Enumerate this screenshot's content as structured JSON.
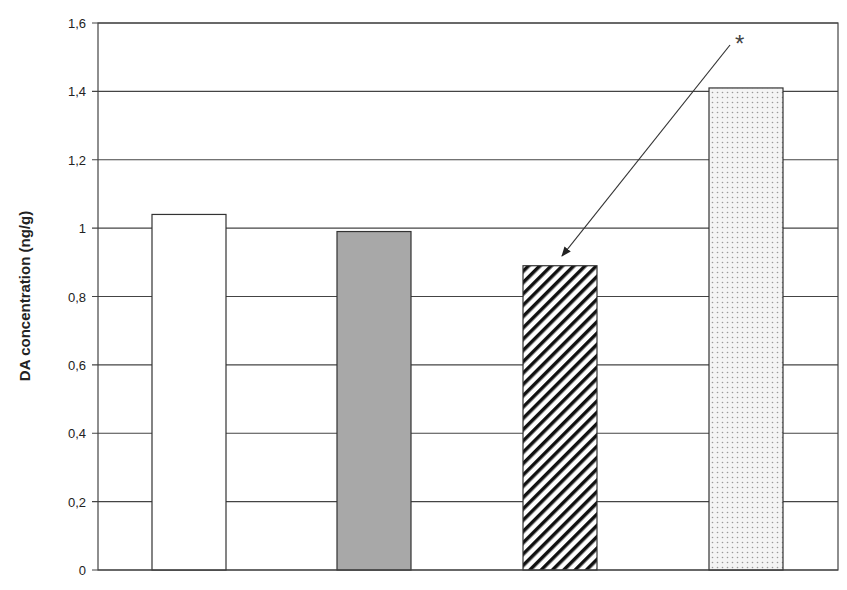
{
  "chart_data": {
    "type": "bar",
    "title": "",
    "xlabel": "",
    "ylabel": "DA concentration (ng/g)",
    "ylim": [
      0,
      1.6
    ],
    "yticks": [
      "0",
      "0,2",
      "0,4",
      "0,6",
      "0,8",
      "1",
      "1,2",
      "1,4",
      "1,6"
    ],
    "grid": true,
    "categories": [
      "Group 1",
      "Group 2",
      "Group 3",
      "Group 4"
    ],
    "values": [
      1.04,
      0.99,
      0.89,
      1.41
    ],
    "bar_fills": [
      "white",
      "gray",
      "diagonal-hatch",
      "dotted"
    ],
    "annotations": [
      {
        "text": "*",
        "target_bar": 2,
        "type": "arrow"
      }
    ]
  },
  "labels": {
    "ylabel": "DA concentration (ng/g)",
    "annotation": "*"
  }
}
